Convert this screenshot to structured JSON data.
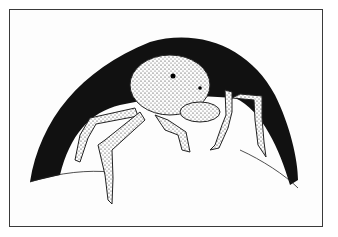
{
  "image": {
    "description": "Black-and-white stippled pen illustration of a hairy spider emerging from a dark, arch-shaped burrow opening",
    "subject": "spider",
    "style": "stipple ink drawing",
    "colors": {
      "ink": "#111111",
      "paper": "#fdfdfd",
      "frame": "#3a3a3a"
    }
  }
}
